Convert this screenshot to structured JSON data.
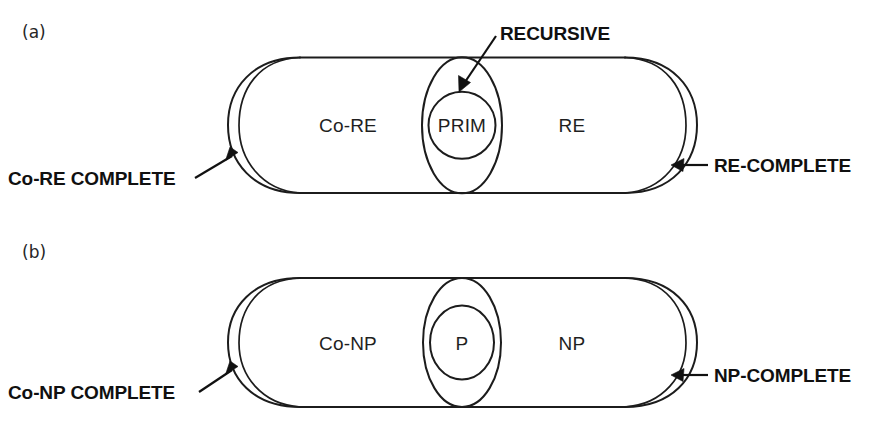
{
  "figure": {
    "kind": "venn-diagram-pair",
    "background_color": "#ffffff",
    "stroke_color": "#1c1c1c"
  },
  "panels": [
    {
      "id": "panel-a",
      "tag": "(a)",
      "regions": {
        "left": "Co-RE",
        "center_inner": "PRIM",
        "right": "RE"
      },
      "callouts": {
        "top": "RECURSIVE",
        "left": "Co-RE COMPLETE",
        "right": "RE-COMPLETE"
      }
    },
    {
      "id": "panel-b",
      "tag": "(b)",
      "regions": {
        "left": "Co-NP",
        "center_inner": "P",
        "right": "NP"
      },
      "callouts": {
        "top": "",
        "left": "Co-NP COMPLETE",
        "right": "NP-COMPLETE"
      }
    }
  ]
}
